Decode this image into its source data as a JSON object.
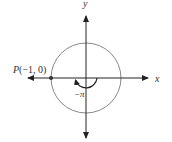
{
  "diagram": {
    "type": "unit-circle",
    "axes": {
      "x_label": "x",
      "y_label": "y"
    },
    "point": {
      "name": "P",
      "coords": "(−1, 0)",
      "x": -1,
      "y": 0
    },
    "angle": {
      "label": "−π",
      "value": "-pi",
      "direction": "clockwise"
    },
    "colors": {
      "axis": "#222222",
      "circle": "#777777",
      "text": "#333333"
    }
  }
}
